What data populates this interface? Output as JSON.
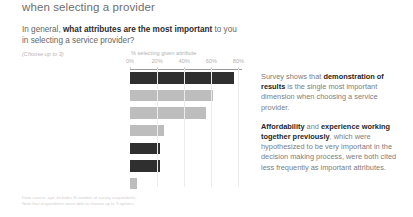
{
  "header": {
    "title": "when selecting a provider"
  },
  "question": {
    "lead": "In general, ",
    "emphasis": "what attributes are the most important",
    "tail": " to you in selecting a service provider?",
    "choose_note": "(Choose up to 3)"
  },
  "chart_data": {
    "type": "bar",
    "orientation": "horizontal",
    "title": "",
    "xlabel": "% selecting given attribute",
    "ylabel": "",
    "xlim": [
      0,
      80
    ],
    "grid": true,
    "tick_labels": [
      "0%",
      "20%",
      "40%",
      "60%",
      "80%"
    ],
    "tick_values": [
      0,
      20,
      40,
      60,
      80
    ],
    "categories": [
      "Demonstration of results",
      "Content expertise",
      "Local knowledge",
      "National reputation",
      "Affordability of services",
      "Previous work together",
      "Colleague recommendation"
    ],
    "values": [
      77,
      61,
      56,
      25,
      22,
      22,
      5
    ],
    "bar_styles": [
      "dark",
      "light",
      "light",
      "light",
      "dark",
      "dark",
      "light"
    ],
    "colors": {
      "dark": "#2f2f2f",
      "light": "#bdbdbd",
      "axis": "#9b9b9b",
      "grid": "#ececec"
    }
  },
  "commentary": [
    {
      "segments": [
        {
          "text": "Survey shows that ",
          "bold": false
        },
        {
          "text": "demonstration of results",
          "bold": true
        },
        {
          "text": " is the single most important dimension when choosing a service provider.",
          "bold": false
        }
      ]
    },
    {
      "segments": [
        {
          "text": "Affordability",
          "bold": true
        },
        {
          "text": " and ",
          "bold": false
        },
        {
          "text": "experience working together previously",
          "bold": true
        },
        {
          "text": ", which were hypothesized to be very important in the decision making process, were both cited less frequently as important attributes.",
          "bold": false
        }
      ]
    }
  ],
  "footnote": {
    "line1": "Data source: xyz; includes N number of survey respondents.",
    "line2": "Note that respondents were able to choose up to 3 options."
  }
}
